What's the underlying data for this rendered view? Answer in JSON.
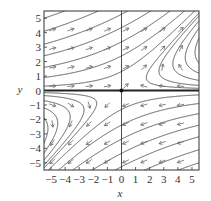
{
  "chart_data": {
    "type": "phase_portrait",
    "title": "",
    "xlabel": "x",
    "ylabel": "y",
    "xlim": [
      -5.5,
      5.5
    ],
    "ylim": [
      -5.5,
      5.5
    ],
    "xticks": [
      -5,
      -4,
      -3,
      -2,
      -1,
      0,
      1,
      2,
      3,
      4,
      5
    ],
    "yticks": [
      -5,
      -4,
      -3,
      -2,
      -1,
      0,
      1,
      2,
      3,
      4,
      5
    ],
    "xtick_labels": [
      "−5",
      "−4",
      "−3",
      "−2",
      "−1",
      "0",
      "1",
      "2",
      "3",
      "4",
      "5"
    ],
    "ytick_labels": [
      "−5",
      "−4",
      "−3",
      "−2",
      "−1",
      "0",
      "1",
      "2",
      "3",
      "4",
      "5"
    ],
    "grid": false,
    "system": {
      "dx": "-x + 2y",
      "dy": "y",
      "approximate": true
    },
    "equilibrium": {
      "x": 0,
      "y": 0,
      "type": "saddle"
    },
    "invariant_lines": [
      {
        "name": "y = 0",
        "emphasized": true
      },
      {
        "name": "x = 0",
        "emphasized": false
      }
    ],
    "arrow_grid_step": 1.3,
    "trajectory_seeds": [
      [
        -5.5,
        0.3
      ],
      [
        -5.5,
        0.9
      ],
      [
        -5.5,
        1.6
      ],
      [
        -5.5,
        2.4
      ],
      [
        -5.5,
        3.2
      ],
      [
        -5.5,
        4.1
      ],
      [
        -5.5,
        5.0
      ],
      [
        5.5,
        0.15
      ],
      [
        5.5,
        0.35
      ],
      [
        5.5,
        0.7
      ],
      [
        5.5,
        1.2
      ],
      [
        5.5,
        1.9
      ],
      [
        5.5,
        -0.3
      ],
      [
        5.5,
        -0.9
      ],
      [
        5.5,
        -1.6
      ],
      [
        5.5,
        -2.4
      ],
      [
        5.5,
        -3.2
      ],
      [
        5.5,
        -4.1
      ],
      [
        5.5,
        -5.0
      ],
      [
        -5.5,
        -0.15
      ],
      [
        -5.5,
        -0.35
      ],
      [
        -5.5,
        -0.7
      ],
      [
        -5.5,
        -1.2
      ],
      [
        -5.5,
        -1.9
      ]
    ]
  },
  "colors": {
    "curve": "#555555",
    "arrow": "#666666",
    "axis": "#222222",
    "frame": "#333333"
  }
}
